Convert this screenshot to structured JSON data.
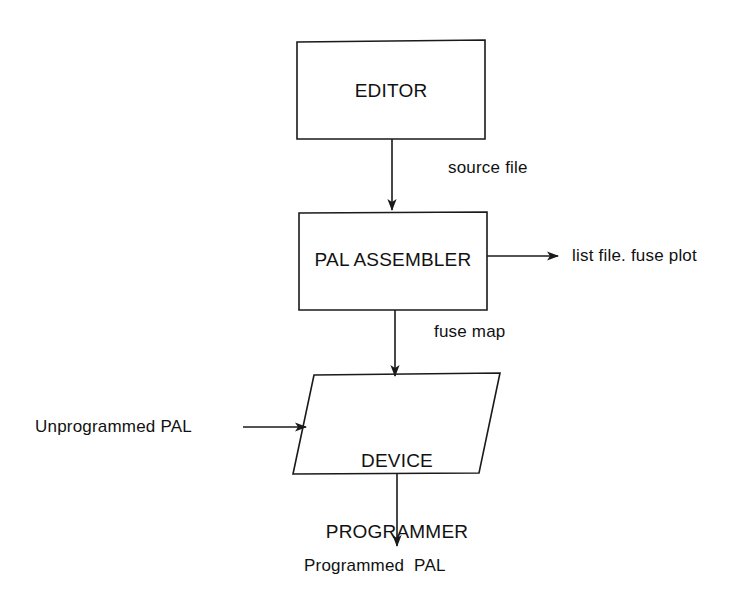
{
  "diagram": {
    "type": "flowchart",
    "orientation": "top-to-bottom",
    "background_color": "#ffffff",
    "line_color": "#1a1a1a",
    "text_color": "#111111",
    "nodes": [
      {
        "id": "editor",
        "label": "EDITOR",
        "shape": "rectangle",
        "x": 297,
        "y": 40,
        "width": 188,
        "height": 99
      },
      {
        "id": "pal_assembler",
        "label": "PAL ASSEMBLER",
        "shape": "rectangle",
        "x": 299,
        "y": 212,
        "width": 188,
        "height": 98
      },
      {
        "id": "device_programmer",
        "label_line1": "DEVICE",
        "label_line2": "PROGRAMMER",
        "shape": "parallelogram",
        "x": 291,
        "y": 373,
        "width": 209,
        "height": 101
      }
    ],
    "edges": [
      {
        "id": "editor-to-assembler",
        "from": "editor",
        "to": "pal_assembler",
        "label": "source file",
        "direction": "down"
      },
      {
        "id": "assembler-to-outputs",
        "from": "pal_assembler",
        "to": "",
        "label": "list file. fuse plot",
        "direction": "right"
      },
      {
        "id": "assembler-to-programmer",
        "from": "pal_assembler",
        "to": "device_programmer",
        "label": "fuse map",
        "direction": "down"
      },
      {
        "id": "input-to-programmer",
        "from": "",
        "to": "device_programmer",
        "label": "Unprogrammed PAL",
        "direction": "right"
      },
      {
        "id": "programmer-to-output",
        "from": "device_programmer",
        "to": "",
        "label": "Programmed  PAL",
        "direction": "down"
      }
    ]
  }
}
